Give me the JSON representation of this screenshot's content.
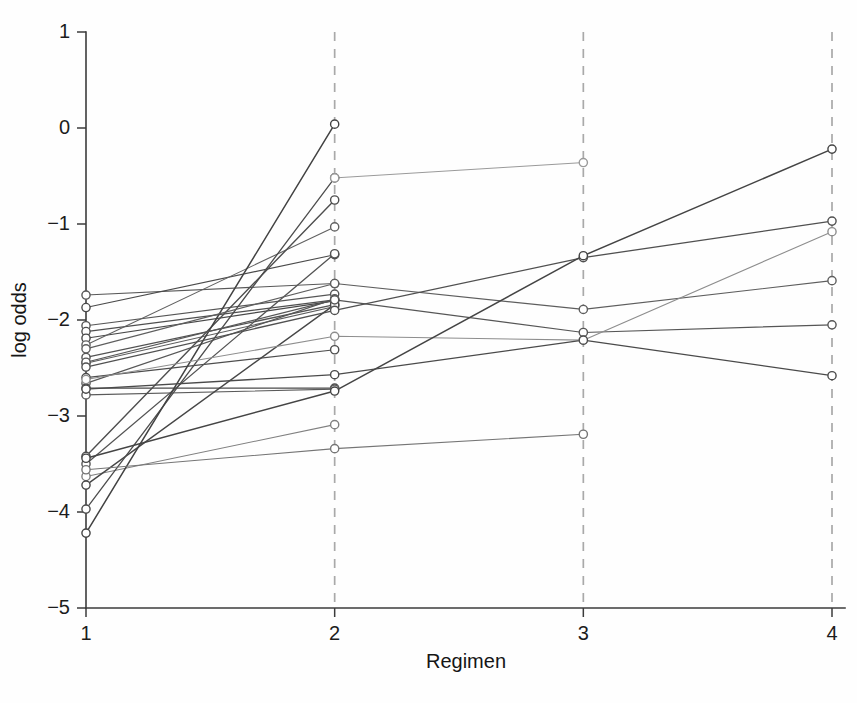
{
  "figure": {
    "title": "",
    "background_color": "#fefefe"
  },
  "chart_data": {
    "type": "line",
    "title": "",
    "subtitle": "",
    "xlabel": "Regimen",
    "ylabel": "log odds",
    "xlim": [
      1,
      4
    ],
    "ylim": [
      -5,
      1
    ],
    "xticks": [
      1,
      2,
      3,
      4
    ],
    "xticklabels": [
      "1",
      "2",
      "3",
      "4"
    ],
    "yticks": [
      1,
      0,
      -1,
      -2,
      -3,
      -4,
      -5
    ],
    "yticklabels": [
      "1",
      "0",
      "−1",
      "−2",
      "−3",
      "−4",
      "−5"
    ],
    "grid": "vertical-dashed-at-x2-x3-x4",
    "legend": "none",
    "x": [
      1,
      2,
      3,
      4
    ],
    "series": [
      {
        "name": "s01",
        "color": "#585858",
        "width": 1.1,
        "x": [
          1,
          2
        ],
        "values": [
          -1.74,
          -1.62
        ]
      },
      {
        "name": "s02",
        "color": "#4a4a4a",
        "width": 1.2,
        "x": [
          1,
          2
        ],
        "values": [
          -1.87,
          -1.32
        ]
      },
      {
        "name": "s03",
        "color": "#555555",
        "width": 1.1,
        "x": [
          1,
          2
        ],
        "values": [
          -2.06,
          -1.73
        ]
      },
      {
        "name": "s04",
        "color": "#4f4f4f",
        "width": 1.3,
        "x": [
          1,
          2
        ],
        "values": [
          -2.12,
          -1.79
        ]
      },
      {
        "name": "s05",
        "color": "#484848",
        "width": 1.2,
        "x": [
          1,
          2
        ],
        "values": [
          -2.19,
          -1.8
        ]
      },
      {
        "name": "s06",
        "color": "#606060",
        "width": 1.1,
        "x": [
          1,
          2
        ],
        "values": [
          -2.26,
          -1.03
        ]
      },
      {
        "name": "s07",
        "color": "#525252",
        "width": 1.3,
        "x": [
          1,
          2
        ],
        "values": [
          -2.39,
          -1.84
        ]
      },
      {
        "name": "s08",
        "color": "#5c5c5c",
        "width": 1.1,
        "x": [
          1,
          2
        ],
        "values": [
          -2.45,
          -1.86
        ]
      },
      {
        "name": "s09",
        "color": "#4d4d4d",
        "width": 1.2,
        "x": [
          1,
          2
        ],
        "values": [
          -2.6,
          -2.31
        ]
      },
      {
        "name": "s10",
        "color": "#575757",
        "width": 1.2,
        "x": [
          1,
          2
        ],
        "values": [
          -2.66,
          -1.78
        ]
      },
      {
        "name": "s11",
        "color": "#4b4b4b",
        "width": 1.3,
        "x": [
          1,
          2
        ],
        "values": [
          -2.71,
          -2.71
        ]
      },
      {
        "name": "s12",
        "color": "#5a5a5a",
        "width": 1.1,
        "x": [
          1,
          2
        ],
        "values": [
          -2.78,
          -2.72
        ]
      },
      {
        "name": "s13",
        "color": "#4e4e4e",
        "width": 1.4,
        "x": [
          1,
          2
        ],
        "values": [
          -3.42,
          -0.75
        ]
      },
      {
        "name": "s14",
        "color": "#535353",
        "width": 1.3,
        "x": [
          1,
          2
        ],
        "values": [
          -3.5,
          -1.31
        ]
      },
      {
        "name": "s15",
        "color": "#808080",
        "width": 1.1,
        "x": [
          1,
          2
        ],
        "values": [
          -3.63,
          -3.09
        ]
      },
      {
        "name": "s16",
        "color": "#464646",
        "width": 1.4,
        "x": [
          1,
          2
        ],
        "values": [
          -3.72,
          -1.84
        ]
      },
      {
        "name": "s17",
        "color": "#4c4c4c",
        "width": 1.3,
        "x": [
          1,
          2
        ],
        "values": [
          -3.97,
          -0.52
        ]
      },
      {
        "name": "s18",
        "color": "#424242",
        "width": 1.5,
        "x": [
          1,
          2
        ],
        "values": [
          -4.22,
          0.04
        ]
      },
      {
        "name": "s19",
        "color": "#9a9a9a",
        "width": 1.0,
        "x": [
          2,
          3
        ],
        "values": [
          -0.52,
          -0.36
        ]
      },
      {
        "name": "s20",
        "color": "#5e5e5e",
        "width": 1.2,
        "x": [
          1,
          2,
          3,
          4
        ],
        "values": [
          -2.3,
          -1.62,
          -1.89,
          -1.59
        ]
      },
      {
        "name": "s21",
        "color": "#565656",
        "width": 1.2,
        "x": [
          1,
          2,
          3,
          4
        ],
        "values": [
          -2.44,
          -1.79,
          -2.13,
          -2.05
        ]
      },
      {
        "name": "s22",
        "color": "#505050",
        "width": 1.3,
        "x": [
          1,
          2,
          3,
          4
        ],
        "values": [
          -2.49,
          -1.9,
          -1.35,
          -0.97
        ]
      },
      {
        "name": "s23",
        "color": "#8d8d8d",
        "width": 1.1,
        "x": [
          1,
          2,
          3,
          4
        ],
        "values": [
          -2.62,
          -2.17,
          -2.21,
          -1.08
        ]
      },
      {
        "name": "s24",
        "color": "#444444",
        "width": 1.5,
        "x": [
          1,
          2,
          3,
          4
        ],
        "values": [
          -3.44,
          -2.74,
          -1.33,
          -0.22
        ]
      },
      {
        "name": "s25",
        "color": "#4a4a4a",
        "width": 1.3,
        "x": [
          1,
          2,
          3,
          4
        ],
        "values": [
          -2.72,
          -2.57,
          -2.21,
          -2.58
        ]
      },
      {
        "name": "s26",
        "color": "#757575",
        "width": 1.1,
        "x": [
          1,
          2,
          3
        ],
        "values": [
          -3.56,
          -3.34,
          -3.19
        ]
      }
    ],
    "marker": {
      "shape": "circle-open",
      "radius": 4.1,
      "fill": "#ffffff",
      "stroke_width": 1.4
    }
  }
}
